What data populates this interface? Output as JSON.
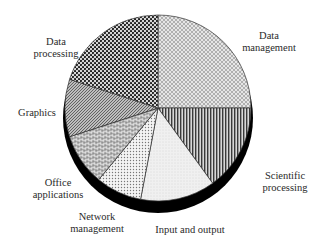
{
  "chart_data": {
    "type": "pie",
    "style": "3d-pie-hatched-monochrome",
    "title": "",
    "start_angle_deg": 0,
    "direction": "clockwise",
    "unit": "percent (estimated from slice angles)",
    "slices": [
      {
        "label": "Data management",
        "value": 25,
        "pattern": "light-crosshatch"
      },
      {
        "label": "Scientific processing",
        "value": 15,
        "pattern": "vertical-lines"
      },
      {
        "label": "Input and output",
        "value": 13,
        "pattern": "light-stipple"
      },
      {
        "label": "Network management",
        "value": 8,
        "pattern": "fine-dots"
      },
      {
        "label": "Office applications",
        "value": 9,
        "pattern": "brick-weave"
      },
      {
        "label": "Graphics",
        "value": 10,
        "pattern": "diagonal-lines"
      },
      {
        "label": "Data processing",
        "value": 20,
        "pattern": "checkerboard-dots"
      }
    ]
  },
  "labels": {
    "data_management": [
      "Data",
      "management"
    ],
    "scientific_processing": [
      "Scientific",
      "processing"
    ],
    "input_output": [
      "Input and output"
    ],
    "network_management": [
      "Network",
      "management"
    ],
    "office_applications": [
      "Office",
      "applications"
    ],
    "graphics": [
      "Graphics"
    ],
    "data_processing": [
      "Data",
      "processing"
    ]
  },
  "colors": {
    "rim": "#000000",
    "outline": "#333333",
    "text": "#2a2a2a",
    "background": "#ffffff"
  }
}
